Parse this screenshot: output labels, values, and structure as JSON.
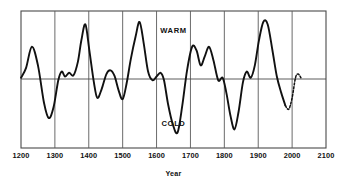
{
  "chart_data": {
    "type": "line",
    "title": "",
    "subtitle": "",
    "xlabel": "Year",
    "ylabel": "",
    "xlim": [
      1200,
      2100
    ],
    "ylim": [
      -1.0,
      1.0
    ],
    "grid": true,
    "grid_orientation": "vertical",
    "legend": "none",
    "zero_line": true,
    "xticks": [
      1200,
      1300,
      1400,
      1500,
      1600,
      1700,
      1800,
      1900,
      2000,
      2100
    ],
    "xtick_labels": [
      "1200",
      "1300",
      "1400",
      "1500",
      "1600",
      "1700",
      "1800",
      "1900",
      "2000",
      "2100"
    ],
    "yticks": [],
    "ytick_labels": [],
    "annotations": [
      {
        "text": "WARM",
        "x": 1650,
        "y": 0.78
      },
      {
        "text": "COLD",
        "x": 1650,
        "y": -0.72
      }
    ],
    "series": [
      {
        "name": "temperature-anomaly",
        "style": "solid",
        "color": "#111111",
        "x": [
          1200,
          1215,
          1232,
          1250,
          1268,
          1282,
          1296,
          1310,
          1320,
          1330,
          1342,
          1355,
          1368,
          1378,
          1390,
          1402,
          1415,
          1425,
          1438,
          1452,
          1464,
          1476,
          1488,
          1500,
          1512,
          1524,
          1538,
          1550,
          1562,
          1575,
          1588,
          1600,
          1612,
          1622,
          1634,
          1648,
          1662,
          1676,
          1690,
          1705,
          1718,
          1730,
          1742,
          1755,
          1768,
          1782,
          1795,
          1806,
          1818,
          1830,
          1842,
          1855,
          1866,
          1878,
          1890,
          1902,
          1915,
          1928,
          1942,
          1955,
          1968,
          1980
        ],
        "y": [
          0.02,
          0.18,
          0.52,
          0.22,
          -0.38,
          -0.62,
          -0.45,
          -0.02,
          0.12,
          0.04,
          0.1,
          0.06,
          0.28,
          0.62,
          0.88,
          0.45,
          -0.05,
          -0.3,
          -0.16,
          0.08,
          0.14,
          0.05,
          -0.18,
          -0.32,
          -0.06,
          0.32,
          0.68,
          0.92,
          0.58,
          0.12,
          -0.02,
          0.04,
          0.1,
          -0.02,
          -0.4,
          -0.72,
          -0.85,
          -0.42,
          0.14,
          0.52,
          0.46,
          0.22,
          0.36,
          0.52,
          0.3,
          -0.02,
          0.02,
          -0.22,
          -0.58,
          -0.8,
          -0.52,
          -0.05,
          0.12,
          0.02,
          0.22,
          0.62,
          0.92,
          0.88,
          0.46,
          0.04,
          -0.22,
          -0.42
        ]
      },
      {
        "name": "temperature-anomaly-projected",
        "style": "dotted",
        "color": "#111111",
        "x": [
          1980,
          1990,
          2000,
          2010,
          2018,
          2026
        ],
        "y": [
          -0.42,
          -0.48,
          -0.3,
          0.02,
          0.08,
          0.02
        ]
      }
    ]
  },
  "axis": {
    "xlabel": "Year"
  },
  "labels": {
    "warm": "WARM",
    "cold": "COLD"
  },
  "ticks": {
    "t0": "1200",
    "t1": "1300",
    "t2": "1400",
    "t3": "1500",
    "t4": "1600",
    "t5": "1700",
    "t6": "1800",
    "t7": "1900",
    "t8": "2000",
    "t9": "2100"
  },
  "colors": {
    "line": "#111111",
    "frame": "#4a4a4a",
    "grid": "#5a5a5a",
    "background": "#ffffff"
  }
}
